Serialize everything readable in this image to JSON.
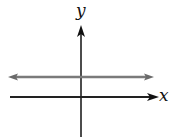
{
  "diagram": {
    "type": "coordinate-plane",
    "x_axis_label": "x",
    "y_axis_label": "y",
    "horizontal_line": {
      "description": "horizontal line above the x-axis, double-arrowed",
      "color": "#7a7a7a"
    },
    "axis_color": "#111111"
  }
}
